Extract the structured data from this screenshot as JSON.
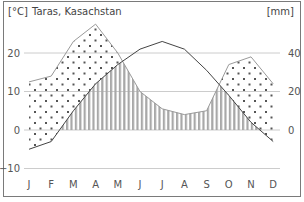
{
  "chart_data": {
    "type": "line",
    "title": "Taras, Kasachstan",
    "left_unit": "[°C]",
    "right_unit": "[mm]",
    "categories": [
      "J",
      "F",
      "M",
      "A",
      "M",
      "J",
      "J",
      "A",
      "S",
      "O",
      "N",
      "D"
    ],
    "series": [
      {
        "name": "Temperature",
        "axis": "left",
        "unit": "°C",
        "values": [
          -5,
          -3,
          5,
          12,
          17,
          21,
          23,
          21,
          15.5,
          9,
          2,
          -3
        ]
      },
      {
        "name": "Precipitation",
        "axis": "right",
        "unit": "mm",
        "values": [
          25,
          28,
          46,
          55,
          40,
          20,
          11,
          8,
          10,
          34,
          38,
          24
        ]
      }
    ],
    "left_ticks": [
      20,
      10,
      0,
      -10
    ],
    "left_tick_labels": [
      "20",
      "10",
      "0",
      "−10"
    ],
    "right_ticks": [
      40,
      20,
      0
    ],
    "right_tick_labels": [
      "40",
      "20",
      "0"
    ],
    "left_ylim": [
      -10,
      25
    ],
    "right_ylim": [
      -20,
      50
    ],
    "grid": true,
    "humid_fill": "vertical-stripes",
    "arid_fill": "dots",
    "colors": {
      "temperature": "#444444",
      "precipitation": "#9a9a9a",
      "stripes": "#a8a8a8",
      "dots": "#555555",
      "grid": "#cccccc"
    }
  }
}
